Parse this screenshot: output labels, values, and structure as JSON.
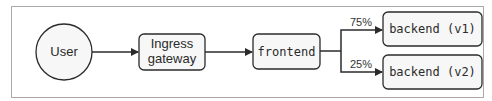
{
  "diagram": {
    "nodes": [
      {
        "id": "user",
        "label": "User",
        "shape": "circle"
      },
      {
        "id": "ingress",
        "label_line1": "Ingress",
        "label_line2": "gateway",
        "shape": "rounded-rect"
      },
      {
        "id": "frontend",
        "label": "frontend",
        "shape": "rounded-rect"
      },
      {
        "id": "backend_v1",
        "label": "backend (v1)",
        "shape": "rounded-rect"
      },
      {
        "id": "backend_v2",
        "label": "backend (v2)",
        "shape": "rounded-rect"
      }
    ],
    "edges": [
      {
        "from": "user",
        "to": "ingress",
        "label": ""
      },
      {
        "from": "ingress",
        "to": "frontend",
        "label": ""
      },
      {
        "from": "frontend",
        "to": "backend_v1",
        "label": "75%"
      },
      {
        "from": "frontend",
        "to": "backend_v2",
        "label": "25%"
      }
    ]
  },
  "colors": {
    "stroke": "#2b2b2b",
    "node_fill": "#f7f7f7",
    "frame": "#a9a9a9"
  }
}
